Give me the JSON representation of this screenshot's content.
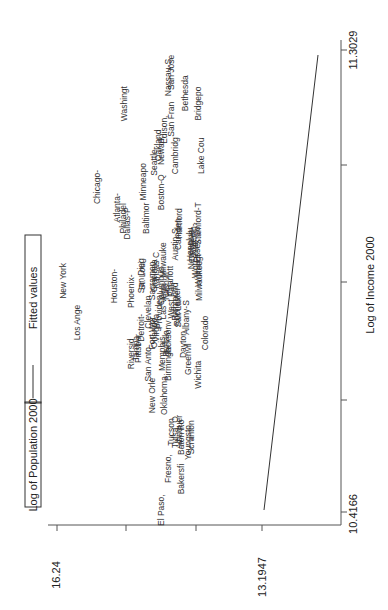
{
  "chart_data": {
    "type": "scatter",
    "orientation": "rotated-90-ccw",
    "title": "",
    "xlabel": "Log of Income 2000",
    "ylabel": "",
    "legend": {
      "position": "top",
      "entries": [
        "Log of Population 2000",
        "Fitted values"
      ]
    },
    "x_ticks": [
      "10.4166",
      "11.3029"
    ],
    "y_ticks": [
      "13.1947",
      "16.24"
    ],
    "xlim": [
      10.4166,
      11.3029
    ],
    "ylim": [
      13.1947,
      16.24
    ],
    "grid": false,
    "fitted_line": {
      "x": [
        10.4166,
        11.3029
      ],
      "y": [
        13.22,
        14.75
      ]
    },
    "series": [
      {
        "name": "Log of Population 2000",
        "marker": "label",
        "points": [
          {
            "label": "New York",
            "x": 10.86,
            "y": 16.1
          },
          {
            "label": "Los Ange",
            "x": 10.78,
            "y": 15.9
          },
          {
            "label": "Chicago-",
            "x": 11.04,
            "y": 15.6
          },
          {
            "label": "Houston-",
            "x": 10.85,
            "y": 15.35
          },
          {
            "label": "Atlanta-",
            "x": 11.0,
            "y": 15.3
          },
          {
            "label": "Philadel",
            "x": 10.98,
            "y": 15.22
          },
          {
            "label": "Dallas-P",
            "x": 10.97,
            "y": 15.15
          },
          {
            "label": "Washingt",
            "x": 11.2,
            "y": 15.2
          },
          {
            "label": "Phoenix-",
            "x": 10.84,
            "y": 15.1
          },
          {
            "label": "Riversid",
            "x": 10.72,
            "y": 15.1
          },
          {
            "label": "San Dieg",
            "x": 10.87,
            "y": 14.95
          },
          {
            "label": "St. Loui",
            "x": 10.87,
            "y": 14.93
          },
          {
            "label": "Baltimor",
            "x": 10.98,
            "y": 14.88
          },
          {
            "label": "Minneapo",
            "x": 11.05,
            "y": 14.92
          },
          {
            "label": "Seattle-",
            "x": 11.09,
            "y": 14.75
          },
          {
            "label": "Nassau-S",
            "x": 11.25,
            "y": 14.55
          },
          {
            "label": "Oakland",
            "x": 11.12,
            "y": 14.7
          },
          {
            "label": "Newark",
            "x": 11.11,
            "y": 14.65
          },
          {
            "label": "Edison,",
            "x": 11.15,
            "y": 14.6
          },
          {
            "label": "San Fran",
            "x": 11.17,
            "y": 14.5
          },
          {
            "label": "San Jose",
            "x": 11.26,
            "y": 14.5
          },
          {
            "label": "Boston-Q",
            "x": 11.03,
            "y": 14.65
          },
          {
            "label": "Cambridg",
            "x": 11.1,
            "y": 14.45
          },
          {
            "label": "Bethesda",
            "x": 11.22,
            "y": 14.3
          },
          {
            "label": "Bridgepo",
            "x": 11.2,
            "y": 14.1
          },
          {
            "label": "Lake Cou",
            "x": 11.1,
            "y": 14.05
          },
          {
            "label": "Clevelan",
            "x": 10.8,
            "y": 14.85
          },
          {
            "label": "Tampa",
            "x": 10.73,
            "y": 15.02
          },
          {
            "label": "Pittsbur",
            "x": 10.73,
            "y": 15.0
          },
          {
            "label": "Detroit-",
            "x": 10.77,
            "y": 14.95
          },
          {
            "label": "Sacramen",
            "x": 10.86,
            "y": 14.78
          },
          {
            "label": "Cincinna",
            "x": 10.87,
            "y": 14.76
          },
          {
            "label": "Kansas C",
            "x": 10.88,
            "y": 14.73
          },
          {
            "label": "Columbus",
            "x": 10.85,
            "y": 14.65
          },
          {
            "label": "Milwauke",
            "x": 10.9,
            "y": 14.62
          },
          {
            "label": "San Anto",
            "x": 10.7,
            "y": 14.85
          },
          {
            "label": "Fort Wor",
            "x": 10.76,
            "y": 14.78
          },
          {
            "label": "Orlando",
            "x": 10.76,
            "y": 14.75
          },
          {
            "label": "Virginia",
            "x": 10.77,
            "y": 14.72
          },
          {
            "label": "Providen",
            "x": 10.8,
            "y": 14.68
          },
          {
            "label": "Las Vega",
            "x": 10.82,
            "y": 14.62
          },
          {
            "label": "Nashvil",
            "x": 10.85,
            "y": 14.57
          },
          {
            "label": "Charlott",
            "x": 10.86,
            "y": 14.52
          },
          {
            "label": "Austin-S",
            "x": 10.93,
            "y": 14.45
          },
          {
            "label": "Camden",
            "x": 10.95,
            "y": 14.4
          },
          {
            "label": "Hartford",
            "x": 10.97,
            "y": 14.38
          },
          {
            "label": "New Orle",
            "x": 10.64,
            "y": 14.78
          },
          {
            "label": "Memphis",
            "x": 10.72,
            "y": 14.63
          },
          {
            "label": "Buffalo",
            "x": 10.74,
            "y": 14.58
          },
          {
            "label": "Jacksonv",
            "x": 10.75,
            "y": 14.55
          },
          {
            "label": "West Pal",
            "x": 10.82,
            "y": 14.5
          },
          {
            "label": "Richmond",
            "x": 10.82,
            "y": 14.45
          },
          {
            "label": "Rochester",
            "x": 10.81,
            "y": 14.42
          },
          {
            "label": "Salt Lak",
            "x": 10.8,
            "y": 14.4
          },
          {
            "label": "Oklahoma",
            "x": 10.64,
            "y": 14.6
          },
          {
            "label": "Birmingh",
            "x": 10.7,
            "y": 14.55
          },
          {
            "label": "Honolulu",
            "x": 10.93,
            "y": 14.22
          },
          {
            "label": "New Have",
            "x": 10.92,
            "y": 14.2
          },
          {
            "label": "Raleigh-",
            "x": 10.94,
            "y": 14.18
          },
          {
            "label": "Worceste",
            "x": 10.9,
            "y": 14.15
          },
          {
            "label": "Essex Co",
            "x": 10.93,
            "y": 14.12
          },
          {
            "label": "Stamford-T",
            "x": 10.97,
            "y": 14.1
          },
          {
            "label": "Dayton,",
            "x": 10.74,
            "y": 14.32
          },
          {
            "label": "Albany-S",
            "x": 10.79,
            "y": 14.28
          },
          {
            "label": "Greenvil",
            "x": 10.71,
            "y": 14.25
          },
          {
            "label": "Wilmingt",
            "x": 10.88,
            "y": 14.1
          },
          {
            "label": "Milwaukee",
            "x": 10.86,
            "y": 14.08
          },
          {
            "label": "Colorado",
            "x": 10.76,
            "y": 14.0
          },
          {
            "label": "Wichita",
            "x": 10.68,
            "y": 14.1
          },
          {
            "label": "Tucson",
            "x": 10.57,
            "y": 14.5
          },
          {
            "label": "Tulsa, O",
            "x": 10.57,
            "y": 14.45
          },
          {
            "label": "Albuquer",
            "x": 10.57,
            "y": 14.38
          },
          {
            "label": "Baton Ro",
            "x": 10.56,
            "y": 14.35
          },
          {
            "label": "Youngsto",
            "x": 10.55,
            "y": 14.25
          },
          {
            "label": "Scranton",
            "x": 10.56,
            "y": 14.2
          },
          {
            "label": "Fresno,",
            "x": 10.5,
            "y": 14.55
          },
          {
            "label": "Bakersfi",
            "x": 10.48,
            "y": 14.35
          },
          {
            "label": "El Paso,",
            "x": 10.42,
            "y": 14.65
          }
        ]
      },
      {
        "name": "Fitted values",
        "marker": "line",
        "points": [
          {
            "x": 10.4166,
            "y": 14.77
          },
          {
            "x": 11.3029,
            "y": 13.25
          }
        ]
      }
    ]
  }
}
